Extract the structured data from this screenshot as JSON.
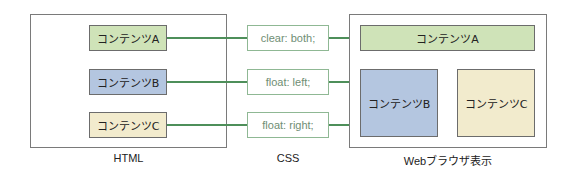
{
  "colors": {
    "green": "#cfe3b8",
    "blue": "#b4c6e0",
    "yellow": "#f2ebcd",
    "line": "#4e8f5a"
  },
  "html_panel": {
    "label": "HTML",
    "items": [
      {
        "text": "コンテンツA"
      },
      {
        "text": "コンテンツB"
      },
      {
        "text": "コンテンツC"
      }
    ]
  },
  "css_panel": {
    "label": "CSS",
    "rules": [
      {
        "text": "clear: both;"
      },
      {
        "text": "float: left;"
      },
      {
        "text": "float: right;"
      }
    ]
  },
  "browser_panel": {
    "label": "Webブラウザ表示",
    "items": [
      {
        "text": "コンテンツA"
      },
      {
        "text": "コンテンツB"
      },
      {
        "text": "コンテンツC"
      }
    ]
  }
}
